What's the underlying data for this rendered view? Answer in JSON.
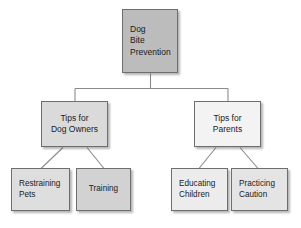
{
  "diagram": {
    "title": "Dog Bite Prevention",
    "type": "tree",
    "background_color": "#ffffff",
    "border_color": "#6e6e6e",
    "text_color": "#1b1b1b",
    "nodes": {
      "root": {
        "id": "dog-bite-prevention",
        "lines": [
          "Dog",
          "Bite",
          "Prevention"
        ],
        "fill": "#bcbcbc",
        "level": 1
      },
      "dog_owners": {
        "id": "tips-for-dog-owners",
        "lines": [
          "Tips for",
          "Dog Owners"
        ],
        "fill": "#dadada",
        "level": 2
      },
      "parents": {
        "id": "tips-for-parents",
        "lines": [
          "Tips for",
          "Parents"
        ],
        "fill": "#f3f3f3",
        "level": 2
      },
      "restraining_pets": {
        "id": "restraining-pets",
        "lines": [
          "Restraining",
          "Pets"
        ],
        "fill": "#dedede",
        "level": 3
      },
      "training": {
        "id": "training",
        "lines": [
          "Training"
        ],
        "fill": "#d2d2d2",
        "level": 3
      },
      "educating_children": {
        "id": "educating-children",
        "lines": [
          "Educating",
          "Children"
        ],
        "fill": "#ececec",
        "level": 3
      },
      "practicing_caution": {
        "id": "practicing-caution",
        "lines": [
          "Practicing",
          "Caution"
        ],
        "fill": "#e4e4e4",
        "level": 3
      }
    },
    "edges": [
      {
        "from": "dog-bite-prevention",
        "to": "tips-for-dog-owners",
        "style": "elbow"
      },
      {
        "from": "dog-bite-prevention",
        "to": "tips-for-parents",
        "style": "elbow"
      },
      {
        "from": "tips-for-dog-owners",
        "to": "restraining-pets",
        "style": "diagonal"
      },
      {
        "from": "tips-for-dog-owners",
        "to": "training",
        "style": "diagonal"
      },
      {
        "from": "tips-for-parents",
        "to": "educating-children",
        "style": "diagonal"
      },
      {
        "from": "tips-for-parents",
        "to": "practicing-caution",
        "style": "diagonal"
      }
    ]
  }
}
